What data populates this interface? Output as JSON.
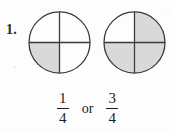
{
  "worksheet": {
    "question_number": "1.",
    "conjunction": "or",
    "colors": {
      "shade_fill": "#d9d9d9",
      "outline": "#3a3a3a",
      "text": "#1d1d1d",
      "background": "#fdfdfd"
    },
    "figures": [
      {
        "name": "circle-one-quarter",
        "shape": "circle",
        "divisions": 4,
        "division_style": "vertical-and-horizontal-diameter",
        "shaded_quadrants": [
          "bottom-left"
        ],
        "shaded_count": 1,
        "total_parts": 4,
        "fraction_shaded": "1/4"
      },
      {
        "name": "circle-three-quarters",
        "shape": "circle",
        "divisions": 4,
        "division_style": "vertical-and-horizontal-diameter",
        "shaded_quadrants": [
          "top-right",
          "bottom-left",
          "bottom-right"
        ],
        "shaded_count": 3,
        "total_parts": 4,
        "fraction_shaded": "3/4"
      }
    ],
    "answer_choices": [
      {
        "numerator": "1",
        "denominator": "4"
      },
      {
        "numerator": "3",
        "denominator": "4"
      }
    ]
  }
}
